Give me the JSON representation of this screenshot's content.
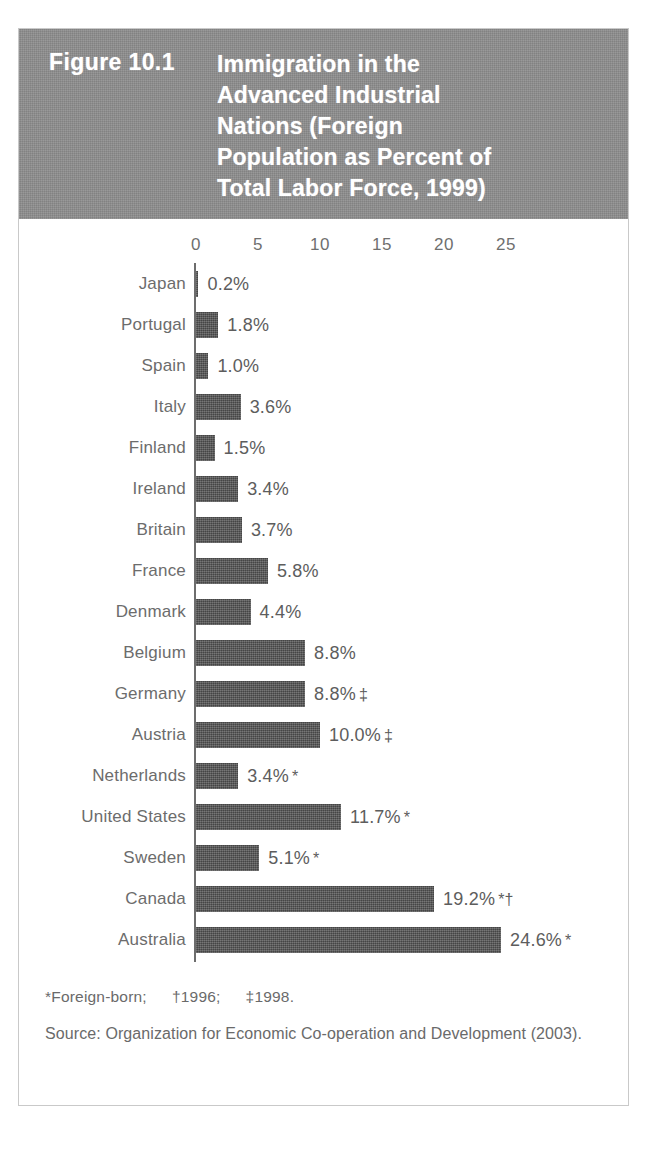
{
  "figure": {
    "number": "Figure 10.1",
    "caption_lines": [
      "Immigration in the",
      "Advanced Industrial",
      "Nations (Foreign",
      "Population as Percent of",
      "Total Labor Force, 1999)"
    ],
    "caption_full": "Immigration in the Advanced Industrial Nations (Foreign Population as Percent of Total Labor Force, 1999)"
  },
  "footnotes": {
    "asterisk": "*Foreign-born;",
    "dagger": "†1996;",
    "double_dagger": "‡1998.",
    "source": "Source: Organization for Economic Co-operation and Development (2003)."
  },
  "colors": {
    "header_band": "#8d8d8d",
    "bar_fill": "#575757",
    "text_gray": "#6a6a6a",
    "frame_border": "#c9c9c9",
    "axis_line": "#6d6d6d"
  },
  "chart_data": {
    "type": "bar",
    "orientation": "horizontal",
    "xlabel": "",
    "ylabel": "",
    "xlim": [
      0,
      27
    ],
    "grid": false,
    "legend": "none",
    "tick_labels": [
      "0",
      "5",
      "10",
      "15",
      "20",
      "25"
    ],
    "tick_values": [
      0,
      5,
      10,
      15,
      20,
      25
    ],
    "categories": [
      "Japan",
      "Portugal",
      "Spain",
      "Italy",
      "Finland",
      "Ireland",
      "Britain",
      "France",
      "Denmark",
      "Belgium",
      "Germany",
      "Austria",
      "Netherlands",
      "United States",
      "Sweden",
      "Canada",
      "Australia"
    ],
    "values": [
      0.2,
      1.8,
      1.0,
      3.6,
      1.5,
      3.4,
      3.7,
      5.8,
      4.4,
      8.8,
      8.8,
      10.0,
      3.4,
      11.7,
      5.1,
      19.2,
      24.6
    ],
    "value_labels": [
      "0.2%",
      "1.8%",
      "1.0%",
      "3.6%",
      "1.5%",
      "3.4%",
      "3.7%",
      "5.8%",
      "4.4%",
      "8.8%",
      "8.8%",
      "10.0%",
      "3.4%",
      "11.7%",
      "5.1%",
      "19.2%",
      "24.6%"
    ],
    "markers": [
      "",
      "",
      "",
      "",
      "",
      "",
      "",
      "",
      "",
      "",
      "‡",
      "‡",
      "*",
      "*",
      "*",
      "*†",
      "*"
    ],
    "rows": [
      {
        "label": "Japan",
        "value": 0.2,
        "value_label": "0.2%",
        "marker": ""
      },
      {
        "label": "Portugal",
        "value": 1.8,
        "value_label": "1.8%",
        "marker": ""
      },
      {
        "label": "Spain",
        "value": 1.0,
        "value_label": "1.0%",
        "marker": ""
      },
      {
        "label": "Italy",
        "value": 3.6,
        "value_label": "3.6%",
        "marker": ""
      },
      {
        "label": "Finland",
        "value": 1.5,
        "value_label": "1.5%",
        "marker": ""
      },
      {
        "label": "Ireland",
        "value": 3.4,
        "value_label": "3.4%",
        "marker": ""
      },
      {
        "label": "Britain",
        "value": 3.7,
        "value_label": "3.7%",
        "marker": ""
      },
      {
        "label": "France",
        "value": 5.8,
        "value_label": "5.8%",
        "marker": ""
      },
      {
        "label": "Denmark",
        "value": 4.4,
        "value_label": "4.4%",
        "marker": ""
      },
      {
        "label": "Belgium",
        "value": 8.8,
        "value_label": "8.8%",
        "marker": ""
      },
      {
        "label": "Germany",
        "value": 8.8,
        "value_label": "8.8%",
        "marker": "‡"
      },
      {
        "label": "Austria",
        "value": 10.0,
        "value_label": "10.0%",
        "marker": "‡"
      },
      {
        "label": "Netherlands",
        "value": 3.4,
        "value_label": "3.4%",
        "marker": "*"
      },
      {
        "label": "United States",
        "value": 11.7,
        "value_label": "11.7%",
        "marker": "*"
      },
      {
        "label": "Sweden",
        "value": 5.1,
        "value_label": "5.1%",
        "marker": "*"
      },
      {
        "label": "Canada",
        "value": 19.2,
        "value_label": "19.2%",
        "marker": "*†"
      },
      {
        "label": "Australia",
        "value": 24.6,
        "value_label": "24.6%",
        "marker": "*"
      }
    ]
  }
}
